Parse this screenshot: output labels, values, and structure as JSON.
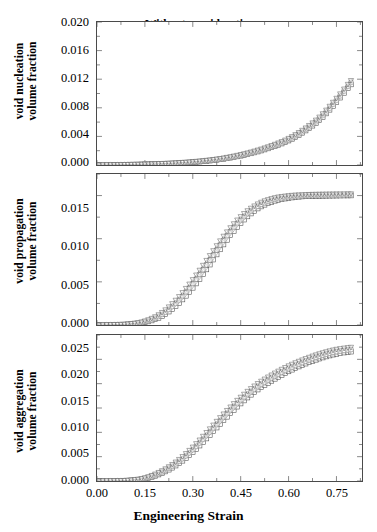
{
  "chart_data": {
    "type": "line",
    "title": "",
    "xlabel": "Engineering Strain",
    "xlim": [
      0.0,
      0.83
    ],
    "xticks": [
      0.0,
      0.15,
      0.3,
      0.45,
      0.6,
      0.75
    ],
    "xticklabels": [
      "0.00",
      "0.15",
      "0.30",
      "0.45",
      "0.60",
      "0.75"
    ],
    "grid": false,
    "legend_position": "upper-left (panel 1)",
    "legend": [
      {
        "label": "Without consideration",
        "marker": "open-square"
      },
      {
        "label": "With residual stress",
        "marker": "open-circle"
      },
      {
        "label": "With welding defect",
        "marker": "open-square-faint"
      },
      {
        "label": "With both consideration",
        "marker": "open-triangle-down"
      }
    ],
    "panels": [
      {
        "name": "void-nucleation",
        "ylabel_line1": "void nucleation",
        "ylabel_line2": "volume fraction",
        "ylim": [
          0.0,
          0.02
        ],
        "yticks": [
          0.0,
          0.004,
          0.008,
          0.012,
          0.016,
          0.02
        ],
        "yticklabels": [
          "0.000",
          "0.004",
          "0.008",
          "0.012",
          "0.016",
          "0.020"
        ],
        "x": [
          0.0,
          0.05,
          0.1,
          0.15,
          0.2,
          0.25,
          0.3,
          0.35,
          0.4,
          0.45,
          0.5,
          0.55,
          0.6,
          0.65,
          0.7,
          0.75,
          0.8
        ],
        "series": [
          {
            "name": "Without consideration",
            "values": [
              0.0,
              2e-05,
              5e-05,
              9e-05,
              0.00015,
              0.00024,
              0.00038,
              0.00058,
              0.00087,
              0.00128,
              0.00182,
              0.00252,
              0.0034,
              0.0047,
              0.0064,
              0.0088,
              0.0115
            ]
          },
          {
            "name": "With residual stress",
            "values": [
              0.0,
              2e-05,
              6e-05,
              0.0001,
              0.00017,
              0.00027,
              0.00042,
              0.00063,
              0.00093,
              0.00136,
              0.00192,
              0.00264,
              0.00355,
              0.00488,
              0.00662,
              0.00906,
              0.0118
            ]
          },
          {
            "name": "With welding defect",
            "values": [
              0.0,
              2e-05,
              6e-05,
              0.0001,
              0.00017,
              0.00027,
              0.00042,
              0.00063,
              0.00093,
              0.00136,
              0.00192,
              0.00264,
              0.00355,
              0.00488,
              0.00662,
              0.00906,
              0.0118
            ]
          },
          {
            "name": "With both consideration",
            "values": [
              0.0,
              3e-05,
              7e-05,
              0.00012,
              0.00019,
              0.0003,
              0.00046,
              0.00068,
              0.001,
              0.00145,
              0.00203,
              0.00277,
              0.00371,
              0.00506,
              0.00684,
              0.00932,
              0.01205
            ]
          }
        ]
      },
      {
        "name": "void-propagation",
        "ylabel_line1": "void propagation",
        "ylabel_line2": "volume fraction",
        "ylim": [
          0.0,
          0.0175
        ],
        "yticks": [
          0.0,
          0.005,
          0.01,
          0.015
        ],
        "yticklabels": [
          "0.000",
          "0.005",
          "0.010",
          "0.015"
        ],
        "x": [
          0.0,
          0.05,
          0.1,
          0.15,
          0.2,
          0.25,
          0.3,
          0.35,
          0.4,
          0.45,
          0.5,
          0.55,
          0.6,
          0.65,
          0.7,
          0.75,
          0.8
        ],
        "series": [
          {
            "name": "Without consideration",
            "values": [
              0.0,
              2e-05,
              8e-05,
              0.0003,
              0.00095,
              0.0023,
              0.0043,
              0.0068,
              0.0095,
              0.0118,
              0.0134,
              0.0143,
              0.0147,
              0.0149,
              0.01495,
              0.01498,
              0.015
            ]
          },
          {
            "name": "With residual stress",
            "values": [
              0.0,
              3e-05,
              0.0001,
              0.00038,
              0.00115,
              0.00265,
              0.0048,
              0.00735,
              0.01,
              0.0122,
              0.0137,
              0.0145,
              0.01485,
              0.015,
              0.01505,
              0.01508,
              0.0151
            ]
          },
          {
            "name": "With welding defect",
            "values": [
              0.0,
              3e-05,
              0.0001,
              0.00038,
              0.00115,
              0.00265,
              0.0048,
              0.00735,
              0.01,
              0.0122,
              0.0137,
              0.0145,
              0.01485,
              0.015,
              0.01505,
              0.01508,
              0.0151
            ]
          },
          {
            "name": "With both consideration",
            "values": [
              0.0,
              4e-05,
              0.00013,
              0.00046,
              0.00135,
              0.003,
              0.00525,
              0.00785,
              0.01045,
              0.01255,
              0.01395,
              0.01468,
              0.01498,
              0.0151,
              0.01515,
              0.01518,
              0.0152
            ]
          }
        ]
      },
      {
        "name": "void-aggregation",
        "ylabel_line1": "void aggregation",
        "ylabel_line2": "volume fraction",
        "ylim": [
          0.0,
          0.03
        ],
        "yticks": [
          0.0,
          0.005,
          0.01,
          0.015,
          0.02,
          0.025
        ],
        "yticklabels": [
          "0.000",
          "0.005",
          "0.010",
          "0.015",
          "0.020",
          "0.025"
        ],
        "x": [
          0.0,
          0.05,
          0.1,
          0.15,
          0.2,
          0.25,
          0.3,
          0.35,
          0.4,
          0.45,
          0.5,
          0.55,
          0.6,
          0.65,
          0.7,
          0.75,
          0.8
        ],
        "series": [
          {
            "name": "Without consideration",
            "values": [
              0.0,
              2e-05,
              0.0001,
              0.00045,
              0.0015,
              0.0033,
              0.0059,
              0.0092,
              0.0127,
              0.0159,
              0.0186,
              0.0207,
              0.0225,
              0.024,
              0.0252,
              0.0261,
              0.0266
            ]
          },
          {
            "name": "With residual stress",
            "values": [
              0.0,
              3e-05,
              0.00013,
              0.00055,
              0.00175,
              0.0037,
              0.00645,
              0.00985,
              0.0134,
              0.0166,
              0.01925,
              0.02135,
              0.0231,
              0.02455,
              0.02575,
              0.0266,
              0.02705
            ]
          },
          {
            "name": "With welding defect",
            "values": [
              0.0,
              3e-05,
              0.00013,
              0.00055,
              0.00175,
              0.0037,
              0.00645,
              0.00985,
              0.0134,
              0.0166,
              0.01925,
              0.02135,
              0.0231,
              0.02455,
              0.02575,
              0.0266,
              0.02705
            ]
          },
          {
            "name": "With both consideration",
            "values": [
              0.0,
              4e-05,
              0.00016,
              0.00065,
              0.00198,
              0.00405,
              0.00695,
              0.01045,
              0.014,
              0.0172,
              0.01985,
              0.0219,
              0.02365,
              0.02505,
              0.0262,
              0.02705,
              0.0275
            ]
          }
        ]
      }
    ]
  },
  "axis": {
    "xtitle": "Engineering Strain"
  },
  "panel1": {
    "ylabel_line1": "void nucleation",
    "ylabel_line2": "volume fraction",
    "yt0": "0.000",
    "yt1": "0.004",
    "yt2": "0.008",
    "yt3": "0.012",
    "yt4": "0.016",
    "yt5": "0.020"
  },
  "panel2": {
    "ylabel_line1": "void propagation",
    "ylabel_line2": "volume fraction",
    "yt0": "0.000",
    "yt1": "0.005",
    "yt2": "0.010",
    "yt3": "0.015"
  },
  "panel3": {
    "ylabel_line1": "void aggregation",
    "ylabel_line2": "volume fraction",
    "yt0": "0.000",
    "yt1": "0.005",
    "yt2": "0.010",
    "yt3": "0.015",
    "yt4": "0.020",
    "yt5": "0.025"
  },
  "xticklabels": {
    "t0": "0.00",
    "t1": "0.15",
    "t2": "0.30",
    "t3": "0.45",
    "t4": "0.60",
    "t5": "0.75"
  },
  "legend": {
    "item0": "Without consideration",
    "item1": "With residual stress",
    "item2": "With welding defect",
    "item3": "With both consideration"
  }
}
